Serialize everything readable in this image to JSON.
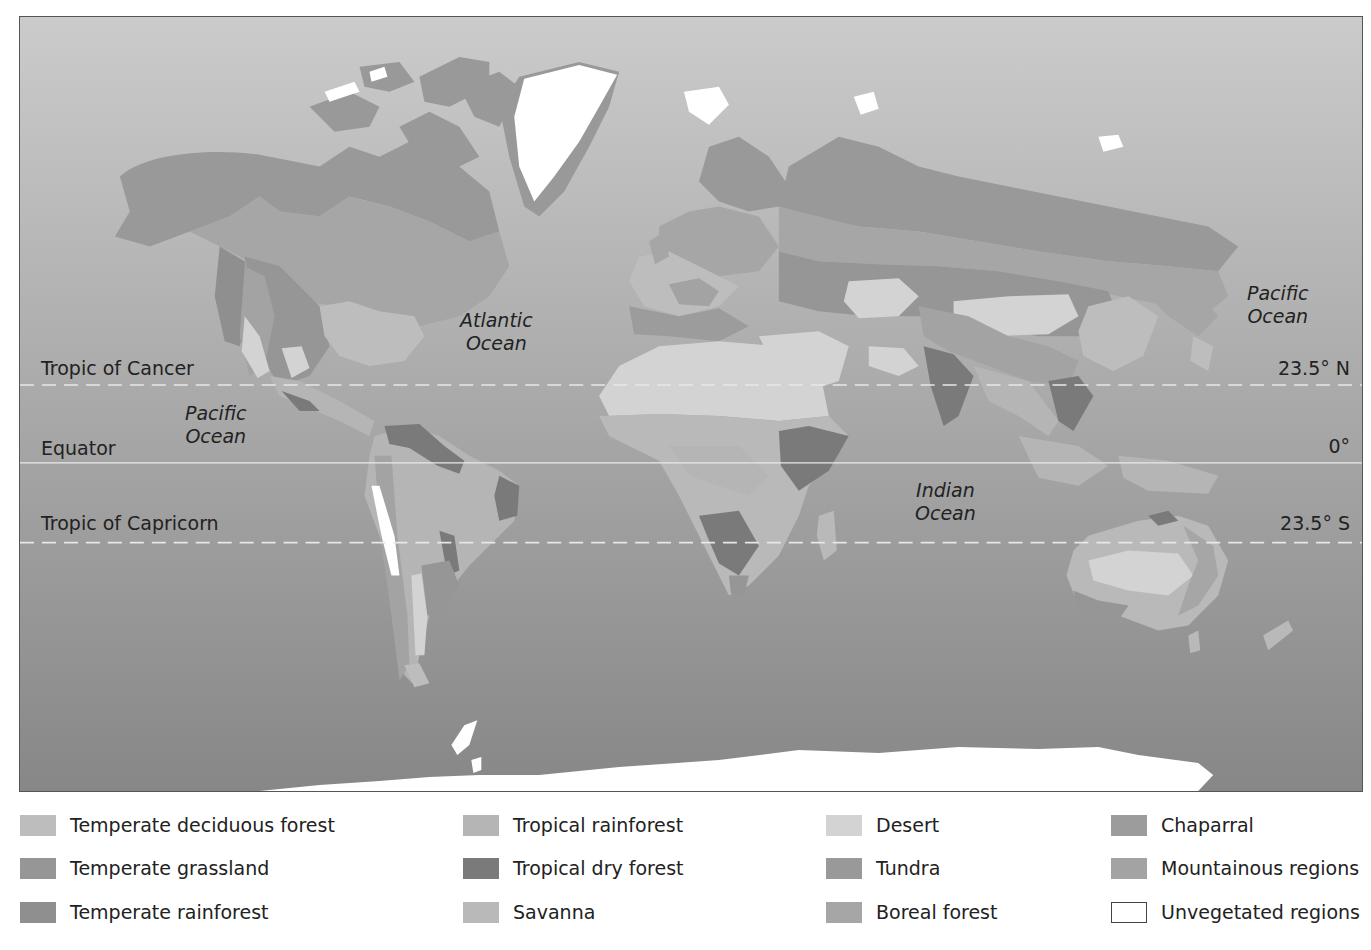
{
  "map": {
    "ocean_gradient": {
      "top": "#cbcbcb",
      "bottom": "#878787"
    },
    "latitude_lines": [
      {
        "name": "Tropic of Cancer",
        "degrees": "23.5° N",
        "style": "dashed"
      },
      {
        "name": "Equator",
        "degrees": "0°",
        "style": "solid"
      },
      {
        "name": "Tropic of Capricorn",
        "degrees": "23.5° S",
        "style": "dashed"
      }
    ],
    "ocean_labels": [
      {
        "name": "Atlantic Ocean",
        "text": "Atlantic\nOcean"
      },
      {
        "name": "Pacific Ocean West",
        "text": "Pacific\nOcean"
      },
      {
        "name": "Pacific Ocean East",
        "text": "Pacific\nOcean"
      },
      {
        "name": "Indian Ocean",
        "text": "Indian\nOcean"
      }
    ]
  },
  "legend": {
    "items": [
      {
        "label": "Temperate deciduous forest",
        "color": "#bdbdbd"
      },
      {
        "label": "Temperate grassland",
        "color": "#969696"
      },
      {
        "label": "Temperate rainforest",
        "color": "#8f8f8f"
      },
      {
        "label": "Tropical rainforest",
        "color": "#b5b5b5"
      },
      {
        "label": "Tropical dry forest",
        "color": "#7a7a7a"
      },
      {
        "label": "Savanna",
        "color": "#b9b9b9"
      },
      {
        "label": "Desert",
        "color": "#d3d3d3"
      },
      {
        "label": "Tundra",
        "color": "#999999"
      },
      {
        "label": "Boreal forest",
        "color": "#a6a6a6"
      },
      {
        "label": "Chaparral",
        "color": "#9c9c9c"
      },
      {
        "label": "Mountainous regions",
        "color": "#a3a3a3"
      },
      {
        "label": "Unvegetated regions",
        "color": "#ffffff"
      }
    ]
  }
}
